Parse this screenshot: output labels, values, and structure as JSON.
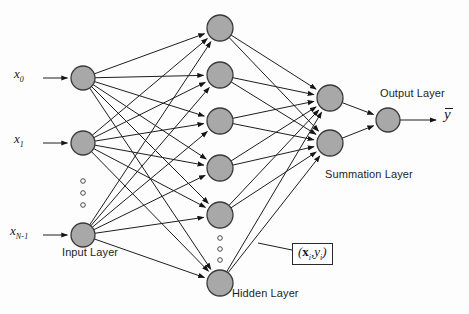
{
  "diagram": {
    "canvas": {
      "width": 469,
      "height": 314,
      "background": "#fdfdfd"
    },
    "style": {
      "node_fill": "#a8a8a8",
      "node_stroke": "#3a3a3a",
      "edge_color": "#1e1e1e",
      "text_color": "#1d1d1d",
      "box_stroke": "#2a2a2a"
    },
    "labels": {
      "input_layer": "Input Layer",
      "hidden_layer": "Hidden Layer",
      "summation_layer": "Summation Layer",
      "output_layer": "Output Layer"
    },
    "inputs": [
      {
        "name": "x0",
        "base": "x",
        "sub": "0",
        "cx": 83,
        "cy": 78
      },
      {
        "name": "x1",
        "base": "x",
        "sub": "1",
        "cx": 83,
        "cy": 143
      },
      {
        "name": "xN-1",
        "base": "x",
        "sub": "N-1",
        "cx": 83,
        "cy": 235
      }
    ],
    "input_ellipsis": {
      "cx": 83,
      "dots": [
        181,
        193,
        205
      ]
    },
    "hidden_nodes": [
      {
        "cx": 220,
        "cy": 28
      },
      {
        "cx": 220,
        "cy": 75
      },
      {
        "cx": 220,
        "cy": 121
      },
      {
        "cx": 220,
        "cy": 168
      },
      {
        "cx": 220,
        "cy": 215
      },
      {
        "cx": 220,
        "cy": 283
      }
    ],
    "hidden_ellipsis": {
      "cx": 220,
      "dots": [
        238,
        249,
        260
      ]
    },
    "summation_nodes": [
      {
        "cx": 330,
        "cy": 98
      },
      {
        "cx": 330,
        "cy": 143
      }
    ],
    "output_node": {
      "cx": 388,
      "cy": 120
    },
    "output_symbol": "y",
    "sample_box": {
      "x_symbol": "x",
      "x_sub": "i",
      "y_symbol": "y",
      "y_sub": "i"
    },
    "node_radius": {
      "input": 12,
      "hidden": 13,
      "summation": 13,
      "output": 12
    }
  }
}
